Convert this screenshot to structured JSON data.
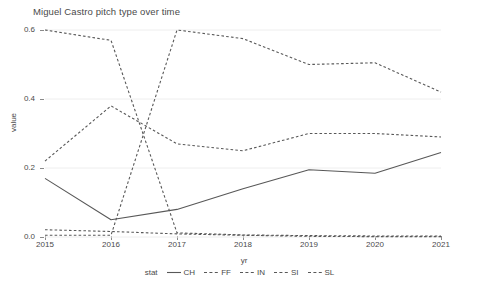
{
  "chart_data": {
    "type": "line",
    "title": "Miguel Castro pitch type over time",
    "xlabel": "yr",
    "ylabel": "value",
    "legend_title": "stat",
    "legend_position": "bottom",
    "grid": true,
    "x": [
      2015,
      2016,
      2017,
      2018,
      2019,
      2020,
      2021
    ],
    "xticklabels": [
      "2015",
      "2016",
      "2017",
      "2018",
      "2019",
      "2020",
      "2021"
    ],
    "yticklabels": [
      "0.0",
      "0.2",
      "0.4",
      "0.6"
    ],
    "ytickvalues": [
      0.0,
      0.2,
      0.4,
      0.6
    ],
    "xlim": [
      2015,
      2021
    ],
    "ylim": [
      0.0,
      0.6
    ],
    "series": [
      {
        "name": "CH",
        "style": "solid",
        "color": "#585858",
        "values": [
          0.17,
          0.05,
          0.08,
          0.14,
          0.195,
          0.185,
          0.245
        ]
      },
      {
        "name": "FF",
        "style": "dashed",
        "color": "#585858",
        "values": [
          0.6,
          0.57,
          0.012,
          0.006,
          0.004,
          0.003,
          0.003
        ]
      },
      {
        "name": "IN",
        "style": "dashed",
        "color": "#585858",
        "values": [
          0.22,
          0.38,
          0.27,
          0.25,
          0.3,
          0.3,
          0.29
        ]
      },
      {
        "name": "SI",
        "style": "dashed",
        "color": "#585858",
        "values": [
          0.005,
          0.005,
          0.6,
          0.575,
          0.5,
          0.505,
          0.42
        ]
      },
      {
        "name": "SL",
        "style": "dashed",
        "color": "#585858",
        "values": [
          0.021,
          0.016,
          0.009,
          0.005,
          0.002,
          0.001,
          0.001
        ]
      }
    ]
  },
  "colors": {
    "grid": "#eeeeee",
    "axis": "#8a8a8a",
    "text": "#4a4a4a",
    "line": "#585858",
    "background": "#ffffff"
  }
}
